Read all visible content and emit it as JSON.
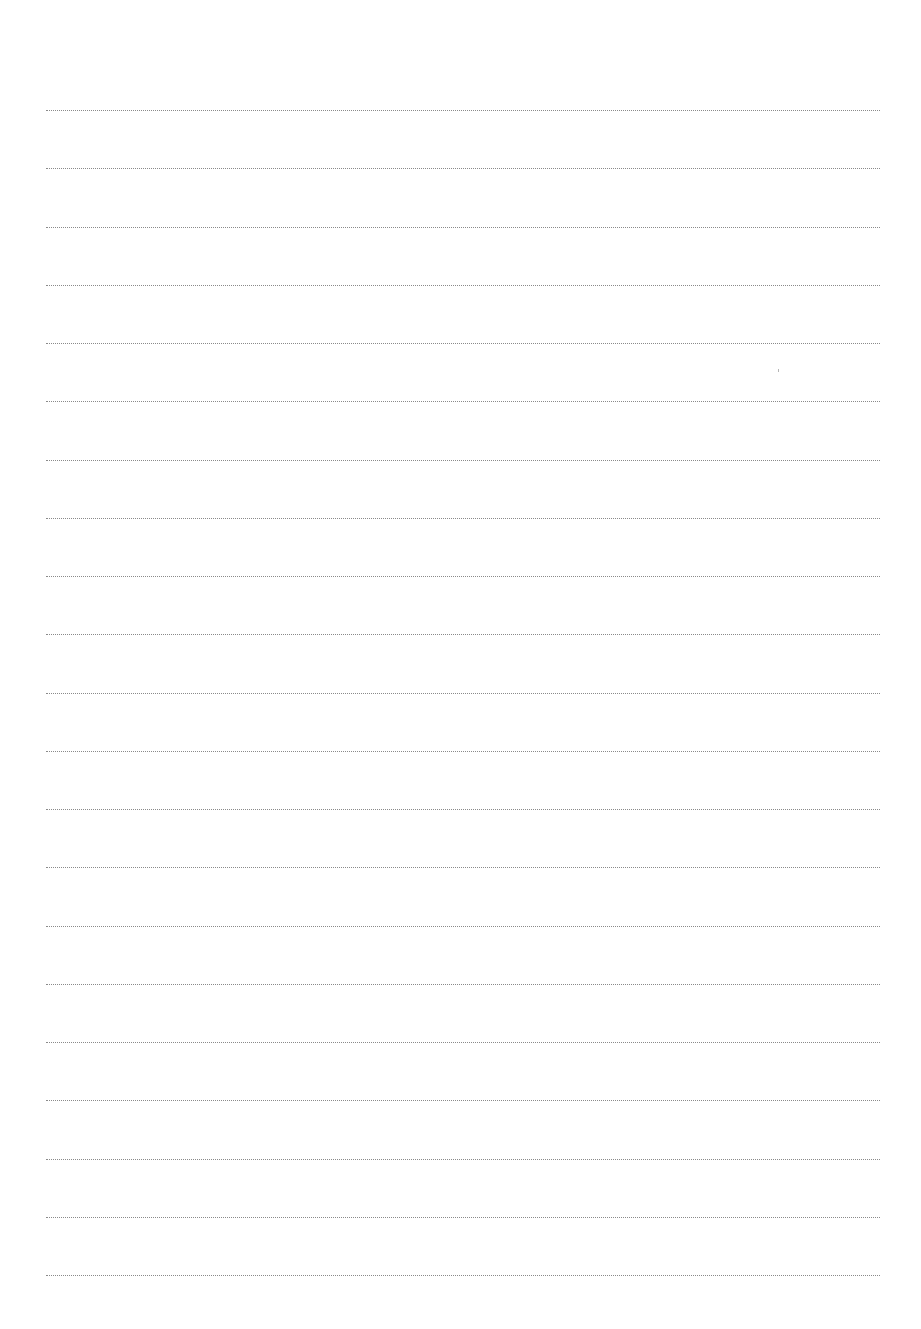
{
  "document": {
    "type": "lined-paper",
    "background_color": "#ffffff",
    "line_color": "#8a8a8a",
    "line_count": 21,
    "line_left_px": 46,
    "line_right_px": 880,
    "first_line_y_px": 110,
    "line_spacing_px": 58.25,
    "lines": [
      {
        "index": 1,
        "y": 110,
        "text": ""
      },
      {
        "index": 2,
        "y": 168,
        "text": ""
      },
      {
        "index": 3,
        "y": 227,
        "text": ""
      },
      {
        "index": 4,
        "y": 285,
        "text": ""
      },
      {
        "index": 5,
        "y": 343,
        "text": ""
      },
      {
        "index": 6,
        "y": 401,
        "text": ""
      },
      {
        "index": 7,
        "y": 460,
        "text": ""
      },
      {
        "index": 8,
        "y": 518,
        "text": ""
      },
      {
        "index": 9,
        "y": 576,
        "text": ""
      },
      {
        "index": 10,
        "y": 634,
        "text": ""
      },
      {
        "index": 11,
        "y": 693,
        "text": ""
      },
      {
        "index": 12,
        "y": 751,
        "text": ""
      },
      {
        "index": 13,
        "y": 809,
        "text": ""
      },
      {
        "index": 14,
        "y": 867,
        "text": ""
      },
      {
        "index": 15,
        "y": 926,
        "text": ""
      },
      {
        "index": 16,
        "y": 984,
        "text": ""
      },
      {
        "index": 17,
        "y": 1042,
        "text": ""
      },
      {
        "index": 18,
        "y": 1100,
        "text": ""
      },
      {
        "index": 19,
        "y": 1159,
        "text": ""
      },
      {
        "index": 20,
        "y": 1217,
        "text": ""
      },
      {
        "index": 21,
        "y": 1275,
        "text": ""
      }
    ]
  }
}
